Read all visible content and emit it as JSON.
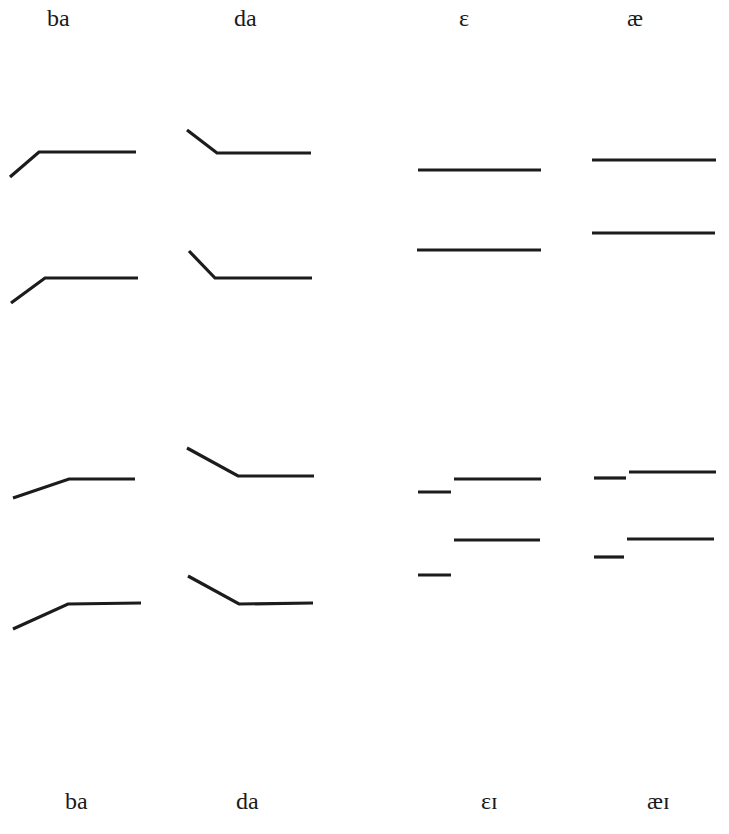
{
  "diagram": {
    "type": "formant-pattern-schematic",
    "line_color": "#1c1c1c",
    "line_width": 3.2,
    "top_labels": [
      {
        "text": "ba",
        "x": 47,
        "y": 8
      },
      {
        "text": "da",
        "x": 234,
        "y": 8
      },
      {
        "text": "ɛ",
        "x": 459,
        "y": 8
      },
      {
        "text": "æ",
        "x": 627,
        "y": 8
      }
    ],
    "bottom_labels": [
      {
        "text": "ba",
        "x": 65,
        "y": 790
      },
      {
        "text": "da",
        "x": 236,
        "y": 790
      },
      {
        "text": "ɛɪ",
        "x": 481,
        "y": 790
      },
      {
        "text": "æɪ",
        "x": 647,
        "y": 790
      }
    ],
    "patterns": [
      {
        "name": "ba-upper",
        "formants": [
          [
            [
              10,
              177
            ],
            [
              39,
              152
            ],
            [
              136,
              152
            ]
          ],
          [
            [
              11,
              303
            ],
            [
              45,
              278
            ],
            [
              138,
              278
            ]
          ]
        ]
      },
      {
        "name": "da-upper",
        "formants": [
          [
            [
              187,
              130
            ],
            [
              217,
              153
            ],
            [
              311,
              153
            ]
          ],
          [
            [
              189,
              251
            ],
            [
              215,
              278
            ],
            [
              312,
              278
            ]
          ]
        ]
      },
      {
        "name": "epsilon",
        "formants": [
          [
            [
              418,
              170
            ],
            [
              541,
              170
            ]
          ],
          [
            [
              417,
              250
            ],
            [
              541,
              250
            ]
          ]
        ]
      },
      {
        "name": "ae",
        "formants": [
          [
            [
              592,
              160
            ],
            [
              716,
              160
            ]
          ],
          [
            [
              592,
              233
            ],
            [
              715,
              233
            ]
          ]
        ]
      },
      {
        "name": "ba-lower",
        "formants": [
          [
            [
              13,
              498
            ],
            [
              69,
              479
            ],
            [
              135,
              479
            ]
          ],
          [
            [
              13,
              629
            ],
            [
              68,
              604
            ],
            [
              141,
              603
            ]
          ]
        ]
      },
      {
        "name": "da-lower",
        "formants": [
          [
            [
              187,
              448
            ],
            [
              238,
              476
            ],
            [
              314,
              476
            ]
          ],
          [
            [
              188,
              576
            ],
            [
              239,
              604
            ],
            [
              313,
              603
            ]
          ]
        ]
      },
      {
        "name": "epsilon-iota",
        "formants": [
          [
            [
              418,
              492
            ],
            [
              451,
              492
            ]
          ],
          [
            [
              454,
              479
            ],
            [
              541,
              479
            ]
          ],
          [
            [
              418,
              575
            ],
            [
              451,
              575
            ]
          ],
          [
            [
              454,
              540
            ],
            [
              540,
              540
            ]
          ]
        ]
      },
      {
        "name": "ae-iota",
        "formants": [
          [
            [
              594,
              478
            ],
            [
              626,
              478
            ]
          ],
          [
            [
              629,
              472
            ],
            [
              716,
              472
            ]
          ],
          [
            [
              594,
              557
            ],
            [
              624,
              557
            ]
          ],
          [
            [
              627,
              539
            ],
            [
              714,
              539
            ]
          ]
        ]
      }
    ]
  }
}
